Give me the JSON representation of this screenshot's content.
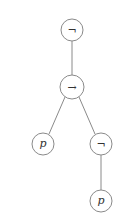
{
  "diagram": {
    "type": "syntax-tree",
    "nodes": [
      {
        "id": "n1",
        "label": "¬",
        "x": 72,
        "y": 30,
        "r": 11,
        "italic": false
      },
      {
        "id": "n2",
        "label": "→",
        "x": 72,
        "y": 87,
        "r": 12,
        "italic": false
      },
      {
        "id": "n3",
        "label": "p",
        "x": 43,
        "y": 144,
        "r": 11,
        "italic": true
      },
      {
        "id": "n4",
        "label": "¬",
        "x": 101,
        "y": 144,
        "r": 11,
        "italic": false
      },
      {
        "id": "n5",
        "label": "p",
        "x": 101,
        "y": 201,
        "r": 11,
        "italic": true
      }
    ],
    "edges": [
      {
        "from": "n1",
        "to": "n2"
      },
      {
        "from": "n2",
        "to": "n3"
      },
      {
        "from": "n2",
        "to": "n4"
      },
      {
        "from": "n4",
        "to": "n5"
      }
    ],
    "colors": {
      "stroke": "#8a8a8a",
      "text": "#333333",
      "background": "#ffffff"
    }
  }
}
